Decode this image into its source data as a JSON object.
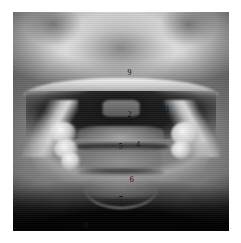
{
  "page": {
    "background_color": "#ffffff",
    "image_type": "radiograph"
  },
  "radiograph": {
    "name": "panoramic-cervical-radiograph",
    "modality": "x-ray",
    "border_color": "#000000",
    "annotation_color": "#000000",
    "annotations": [
      {
        "id": "label-9",
        "text": "9",
        "x": 53,
        "y": 26
      },
      {
        "id": "label-2",
        "text": "2",
        "x": 53,
        "y": 45
      },
      {
        "id": "label-11",
        "text": "11",
        "x": 69,
        "y": 43
      },
      {
        "id": "label-5",
        "text": "5",
        "x": 49,
        "y": 60
      },
      {
        "id": "label-4",
        "text": "4",
        "x": 57,
        "y": 59
      },
      {
        "id": "label-6",
        "text": "6",
        "x": 54,
        "y": 75
      },
      {
        "id": "label-7",
        "text": "7",
        "x": 49,
        "y": 84
      },
      {
        "id": "label-8",
        "text": "8",
        "x": 33,
        "y": 96
      }
    ]
  }
}
